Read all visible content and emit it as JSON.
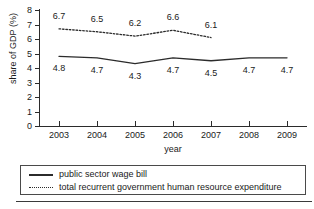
{
  "chart_data": {
    "type": "line",
    "title": "",
    "xlabel": "year",
    "ylabel": "share of GDP (%)",
    "categories": [
      "2003",
      "2004",
      "2005",
      "2006",
      "2007",
      "2008",
      "2009"
    ],
    "x": [
      2003,
      2004,
      2005,
      2006,
      2007,
      2008,
      2009
    ],
    "ylim": [
      0,
      8
    ],
    "yticks": [
      "0",
      "1",
      "2",
      "3",
      "4",
      "5",
      "6",
      "7",
      "8"
    ],
    "ytick_values": [
      0,
      1,
      2,
      3,
      4,
      5,
      6,
      7,
      8
    ],
    "grid": false,
    "legend_position": "bottom",
    "series": [
      {
        "name": "public sector wage bill",
        "style": "solid",
        "color": "#2b2b2b",
        "values": [
          4.8,
          4.7,
          4.3,
          4.7,
          4.5,
          4.7,
          4.7
        ],
        "labels": [
          "4.8",
          "4.7",
          "4.3",
          "4.7",
          "4.5",
          "4.7",
          "4.7"
        ]
      },
      {
        "name": "total recurrent government human resource expenditure",
        "style": "dotted",
        "color": "#2b2b2b",
        "values": [
          6.7,
          6.5,
          6.2,
          6.6,
          6.1,
          null,
          null
        ],
        "labels": [
          "6.7",
          "6.5",
          "6.2",
          "6.6",
          "6.1"
        ]
      }
    ]
  },
  "legend": {
    "items": [
      {
        "label": "public sector wage bill",
        "style": "solid"
      },
      {
        "label": "total recurrent government human resource expenditure",
        "style": "dotted"
      }
    ]
  }
}
